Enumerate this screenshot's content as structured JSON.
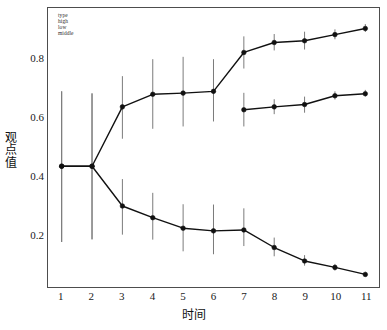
{
  "chart_data": {
    "type": "line",
    "title": "",
    "xlabel": "时间",
    "ylabel": "观点值",
    "xlim": [
      0.55,
      11.45
    ],
    "ylim": [
      0.02,
      0.975
    ],
    "grid": false,
    "legend_position": "top-left",
    "legend_title": "type",
    "x": [
      1,
      2,
      3,
      4,
      5,
      6,
      7,
      8,
      9,
      10,
      11
    ],
    "xticks": [
      "1",
      "2",
      "3",
      "4",
      "5",
      "6",
      "7",
      "8",
      "9",
      "10",
      "11"
    ],
    "yticks": [
      "0.2",
      "0.4",
      "0.6",
      "0.8"
    ],
    "ytick_values": [
      0.2,
      0.4,
      0.6,
      0.8
    ],
    "error_bar_color": "#7a7a7a",
    "line_color": "#111111",
    "marker": "filled-circle",
    "series": [
      {
        "name": "high",
        "x": [
          1,
          2,
          3,
          4,
          5,
          6,
          7,
          8,
          9,
          10,
          11
        ],
        "values": [
          0.434,
          0.434,
          0.637,
          0.68,
          0.684,
          0.69,
          0.823,
          0.857,
          0.863,
          0.884,
          0.905
        ],
        "err_low": [
          0.175,
          0.184,
          0.528,
          0.562,
          0.57,
          0.587,
          0.768,
          0.83,
          0.833,
          0.868,
          0.893
        ],
        "err_high": [
          0.69,
          0.683,
          0.742,
          0.8,
          0.808,
          0.8,
          0.878,
          0.886,
          0.894,
          0.902,
          0.92
        ]
      },
      {
        "name": "low",
        "x": [
          1,
          2,
          3,
          4,
          5,
          6,
          7,
          8,
          9,
          10,
          11
        ],
        "values": [
          0.434,
          0.434,
          0.298,
          0.258,
          0.222,
          0.213,
          0.216,
          0.156,
          0.11,
          0.088,
          0.064
        ],
        "err_low": [
          0.175,
          0.184,
          0.2,
          0.183,
          0.143,
          0.133,
          0.161,
          0.126,
          0.094,
          0.077,
          0.057
        ],
        "err_high": [
          0.69,
          0.683,
          0.39,
          0.343,
          0.304,
          0.303,
          0.29,
          0.19,
          0.13,
          0.1,
          0.073
        ]
      },
      {
        "name": "middle",
        "x": [
          7,
          8,
          9,
          10,
          11
        ],
        "values": [
          0.627,
          0.637,
          0.645,
          0.675,
          0.682
        ],
        "err_low": [
          0.57,
          0.612,
          0.617,
          0.662,
          0.672
        ],
        "err_high": [
          0.685,
          0.663,
          0.672,
          0.69,
          0.695
        ]
      }
    ],
    "legend_entries": [
      "high",
      "low",
      "middle"
    ]
  },
  "axes": {
    "y_title_chars": [
      "观",
      "点",
      "值"
    ],
    "x_title": "时间"
  },
  "caption": ""
}
